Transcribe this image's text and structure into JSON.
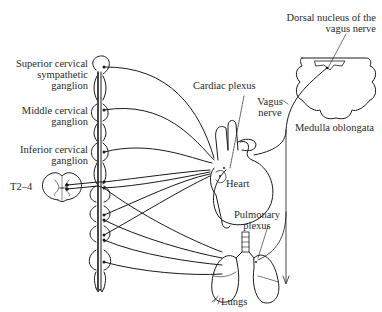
{
  "diagram": {
    "labels": {
      "superior_cervical": [
        "Superior cervical",
        "sympathetic",
        "ganglion"
      ],
      "middle_cervical": [
        "Middle cervical",
        "ganglion"
      ],
      "inferior_cervical": [
        "Inferior cervical",
        "ganglion"
      ],
      "spinal_segment": "T2–4",
      "cardiac_plexus": "Cardiac plexus",
      "vagus_nerve": [
        "Vagus",
        "nerve"
      ],
      "dorsal_nucleus": [
        "Dorsal nucleus of the",
        "vagus nerve"
      ],
      "medulla": "Medulla oblongata",
      "heart": "Heart",
      "pulmonary_plexus": [
        "Pulmonary",
        "plexus"
      ],
      "lungs": "Lungs"
    },
    "colors": {
      "line": "#1a1a1a",
      "text": "#2a2a2a",
      "background": "#ffffff"
    }
  }
}
